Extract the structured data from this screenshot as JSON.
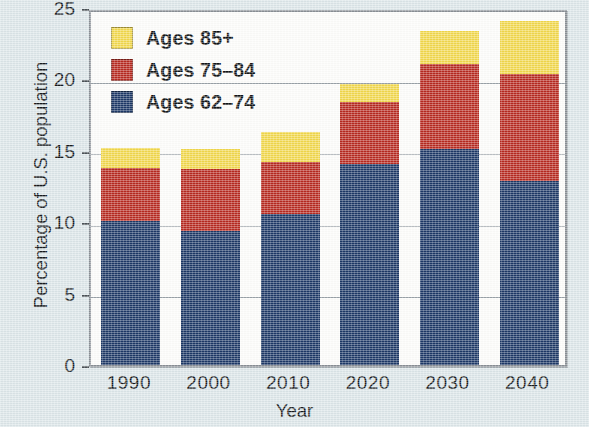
{
  "chart_data": {
    "type": "bar",
    "subtype": "stacked-bar",
    "title": "",
    "xlabel": "Year",
    "ylabel": "Percentage of U.S. population",
    "categories": [
      "1990",
      "2000",
      "2010",
      "2020",
      "2030",
      "2040"
    ],
    "series": [
      {
        "name": "Ages 62–74",
        "color": "#1c3866",
        "values": [
          10.1,
          9.4,
          10.6,
          14.1,
          15.1,
          12.9
        ]
      },
      {
        "name": "Ages 75–84",
        "color": "#b7281f",
        "values": [
          3.7,
          4.3,
          3.6,
          4.3,
          6.0,
          7.5
        ]
      },
      {
        "name": "Ages 85+",
        "color": "#f2d84b",
        "values": [
          1.4,
          1.4,
          2.1,
          1.3,
          2.3,
          3.7
        ]
      }
    ],
    "totals": [
      15.2,
      15.1,
      16.3,
      19.7,
      23.4,
      24.1
    ],
    "ylim": [
      0,
      25
    ],
    "yticks": [
      0,
      5,
      10,
      15,
      20,
      25
    ],
    "ytick_labels": [
      "0",
      "5",
      "10",
      "15",
      "20",
      "25"
    ],
    "grid": true,
    "grid_axis": "y",
    "legend_position": "top-left",
    "legend_order": [
      "Ages 85+",
      "Ages 75–84",
      "Ages 62–74"
    ],
    "background_color": "#dce6e9",
    "plot_background_color": "#fdfdfb",
    "frame_color": "#8a9096"
  },
  "legend": {
    "items": [
      {
        "label": "Ages 85+",
        "color": "#f2d84b",
        "swatch_name": "legend-swatch-ages-85-plus"
      },
      {
        "label": "Ages 75–84",
        "color": "#b7281f",
        "swatch_name": "legend-swatch-ages-75-84"
      },
      {
        "label": "Ages 62–74",
        "color": "#1c3866",
        "swatch_name": "legend-swatch-ages-62-74"
      }
    ]
  },
  "axes": {
    "x": {
      "title": "Year",
      "tick_labels": [
        "1990",
        "2000",
        "2010",
        "2020",
        "2030",
        "2040"
      ]
    },
    "y": {
      "title": "Percentage of U.S. population",
      "tick_labels": [
        "0",
        "5",
        "10",
        "15",
        "20",
        "25"
      ]
    }
  }
}
